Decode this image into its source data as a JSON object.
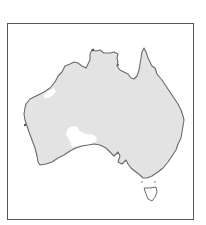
{
  "map": {
    "subject": "Australia",
    "land_color": "#e3e3e3",
    "coast_color": "#6a6a6a",
    "highlight_color": "#ffffff",
    "frame_color": "#555555",
    "regions": [
      {
        "name": "mainland",
        "fill": "land"
      },
      {
        "name": "tasmania",
        "fill": "white"
      },
      {
        "name": "southern-interior-white-area",
        "fill": "white"
      },
      {
        "name": "northwest-coastal-white-area",
        "fill": "white"
      }
    ]
  }
}
